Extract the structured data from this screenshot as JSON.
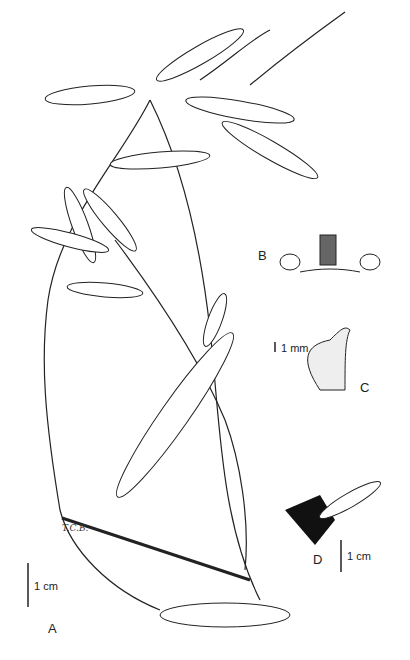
{
  "figure": {
    "type": "botanical illustration",
    "panels": [
      {
        "id": "A",
        "label": "A",
        "description": "Habit of plant with lanceolate serrulate leaves and inflorescences",
        "scale_bar": "1 cm"
      },
      {
        "id": "B",
        "label": "B",
        "description": "Flower with two lateral leaf-like appendages",
        "scale_bar": "1 mm"
      },
      {
        "id": "C",
        "label": "C",
        "description": "Fruit with beaked apex",
        "scale_bar": "1 mm"
      },
      {
        "id": "D",
        "label": "D",
        "description": "Leaf fragment with dark basal portion",
        "scale_bar": "1 cm"
      }
    ],
    "artist_initials": "T.C.B."
  },
  "labels": {
    "a": "A",
    "b": "B",
    "c": "C",
    "d": "D",
    "scale_a": "1 cm",
    "scale_b": "1 mm",
    "scale_d": "1 cm",
    "initials": "T.C.B."
  }
}
